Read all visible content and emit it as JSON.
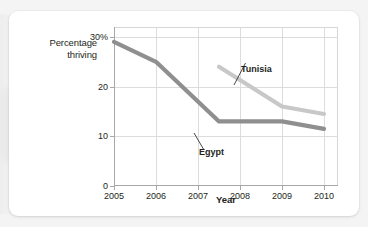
{
  "chart_data": {
    "type": "line",
    "title": "",
    "xlabel": "Year",
    "ylabel_line1": "Percentage",
    "ylabel_line2": "thriving",
    "ytick_labels": [
      "0",
      "10",
      "20",
      "30%"
    ],
    "ytick_values": [
      0,
      10,
      20,
      30
    ],
    "xtick_labels": [
      "2005",
      "2006",
      "2007",
      "2008",
      "2009",
      "2010"
    ],
    "xtick_values": [
      2005,
      2006,
      2007,
      2008,
      2009,
      2010
    ],
    "xlim": [
      2005,
      2010
    ],
    "ylim": [
      0,
      32
    ],
    "grid": true,
    "legend": "inline-labels",
    "series": [
      {
        "name": "Egypt",
        "color": "#8f8f8f",
        "x": [
          2005,
          2006,
          2007.5,
          2009,
          2010
        ],
        "values": [
          29,
          25,
          13,
          13,
          11.5
        ]
      },
      {
        "name": "Tunisia",
        "color": "#c8c8c8",
        "x": [
          2007.5,
          2009,
          2010
        ],
        "values": [
          24,
          16,
          14.5
        ]
      }
    ],
    "annotations": [
      {
        "text": "Tunisia",
        "points_to_series": "Tunisia"
      },
      {
        "text": "Egypt",
        "points_to_series": "Egypt"
      }
    ]
  },
  "colors": {
    "egypt_line": "#8f8f8f",
    "tunisia_line": "#c8c8c8",
    "grid": "#dcdcdc",
    "axis": "#a8a8a8",
    "text": "#231f20",
    "card_background": "#ffffff",
    "page_background": "#f2f2f2"
  }
}
